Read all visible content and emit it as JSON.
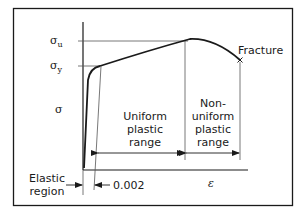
{
  "diagram": {
    "labels": {
      "sigma_u": "σ",
      "sigma_u_sub": "u",
      "sigma_y": "σ",
      "sigma_y_sub": "y",
      "sigma_axis": "σ",
      "epsilon_axis": "ε",
      "fracture": "Fracture",
      "uniform": [
        "Uniform",
        "plastic",
        "range"
      ],
      "nonuniform": [
        "Non-",
        "uniform",
        "plastic",
        "range"
      ],
      "elastic": [
        "Elastic",
        "region"
      ],
      "offset": "0.002"
    },
    "colors": {
      "line": "#1a1a1a",
      "thin_line": "#555555",
      "background": "#ffffff"
    }
  }
}
